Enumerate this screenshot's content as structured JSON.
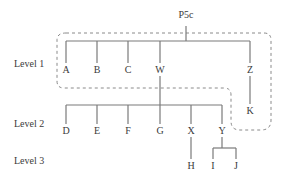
{
  "diagram": {
    "type": "hierarchy-tree",
    "background_color": "#ffffff",
    "line_color": "#7a7a7a",
    "text_color": "#3a3a3a",
    "boundary_style": "dashed-rounded",
    "root": {
      "label": "P5c",
      "x": 186,
      "y": 16
    },
    "level_labels": [
      {
        "label": "Level 1",
        "x": 14,
        "y": 58
      },
      {
        "label": "Level 2",
        "x": 14,
        "y": 118
      },
      {
        "label": "Level 3",
        "x": 14,
        "y": 155
      }
    ],
    "nodes": [
      {
        "id": "A",
        "label": "A",
        "x": 66,
        "y": 72,
        "level": 1
      },
      {
        "id": "B",
        "label": "B",
        "x": 97,
        "y": 72,
        "level": 1
      },
      {
        "id": "C",
        "label": "C",
        "x": 128,
        "y": 72,
        "level": 1
      },
      {
        "id": "W",
        "label": "W",
        "x": 160,
        "y": 72,
        "level": 1
      },
      {
        "id": "Z",
        "label": "Z",
        "x": 250,
        "y": 72,
        "level": 1
      },
      {
        "id": "K",
        "label": "K",
        "x": 250,
        "y": 112,
        "level": 1
      },
      {
        "id": "D",
        "label": "D",
        "x": 66,
        "y": 133,
        "level": 2
      },
      {
        "id": "E",
        "label": "E",
        "x": 97,
        "y": 133,
        "level": 2
      },
      {
        "id": "F",
        "label": "F",
        "x": 128,
        "y": 133,
        "level": 2
      },
      {
        "id": "G",
        "label": "G",
        "x": 160,
        "y": 133,
        "level": 2
      },
      {
        "id": "X",
        "label": "X",
        "x": 191,
        "y": 133,
        "level": 2
      },
      {
        "id": "Y",
        "label": "Y",
        "x": 222,
        "y": 133,
        "level": 2
      },
      {
        "id": "H",
        "label": "H",
        "x": 191,
        "y": 167,
        "level": 3
      },
      {
        "id": "I",
        "label": "I",
        "x": 213,
        "y": 167,
        "level": 3
      },
      {
        "id": "J",
        "label": "J",
        "x": 236,
        "y": 167,
        "level": 3
      }
    ],
    "edges": [
      {
        "from": "P5c",
        "to": "level1-bus"
      },
      {
        "from": "level1-bus",
        "to": "A"
      },
      {
        "from": "level1-bus",
        "to": "B"
      },
      {
        "from": "level1-bus",
        "to": "C"
      },
      {
        "from": "level1-bus",
        "to": "W"
      },
      {
        "from": "level1-bus",
        "to": "Z"
      },
      {
        "from": "Z",
        "to": "K"
      },
      {
        "from": "W",
        "to": "level2-bus"
      },
      {
        "from": "level2-bus",
        "to": "D"
      },
      {
        "from": "level2-bus",
        "to": "E"
      },
      {
        "from": "level2-bus",
        "to": "F"
      },
      {
        "from": "level2-bus",
        "to": "G"
      },
      {
        "from": "level2-bus",
        "to": "X"
      },
      {
        "from": "level2-bus",
        "to": "Y"
      },
      {
        "from": "X",
        "to": "H"
      },
      {
        "from": "Y",
        "to": "I"
      },
      {
        "from": "Y",
        "to": "J"
      }
    ]
  }
}
